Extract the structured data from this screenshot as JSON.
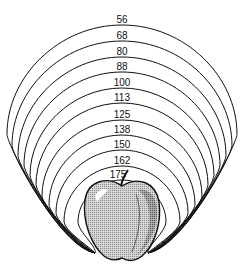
{
  "diagram": {
    "type": "nested-arcs-around-apple",
    "labels": [
      "56",
      "68",
      "80",
      "88",
      "100",
      "113",
      "125",
      "138",
      "150",
      "162",
      "175"
    ],
    "arcs": [
      {
        "label": "56",
        "top": 17,
        "halfWidth": 115
      },
      {
        "label": "68",
        "top": 33,
        "halfWidth": 110
      },
      {
        "label": "80",
        "top": 49,
        "halfWidth": 104
      },
      {
        "label": "88",
        "top": 64,
        "halfWidth": 98
      },
      {
        "label": "100",
        "top": 80,
        "halfWidth": 92
      },
      {
        "label": "113",
        "top": 95,
        "halfWidth": 86
      },
      {
        "label": "125",
        "top": 112,
        "halfWidth": 80
      },
      {
        "label": "138",
        "top": 127,
        "halfWidth": 73
      },
      {
        "label": "150",
        "top": 142,
        "halfWidth": 66
      },
      {
        "label": "162",
        "top": 158,
        "halfWidth": 58
      },
      {
        "label": "175",
        "top": 172,
        "halfWidth": 44
      }
    ],
    "center_x": 122,
    "converge_left": {
      "x": 95,
      "y": 253
    },
    "converge_right": {
      "x": 148,
      "y": 253
    },
    "colors": {
      "line": "#111111",
      "apple_fill": "#c9c9c9",
      "apple_shade": "#9a9a9a",
      "background": "#ffffff"
    }
  }
}
